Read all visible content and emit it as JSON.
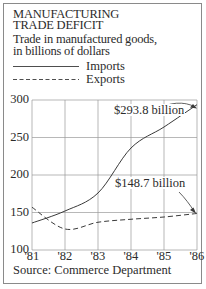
{
  "title": {
    "line1": "MANUFACTURING",
    "line2": "TRADE DEFICIT"
  },
  "subtitle": {
    "line1": "Trade in manufactured goods,",
    "line2": "in billions of dollars"
  },
  "legend": [
    {
      "label": "Imports",
      "style": "solid"
    },
    {
      "label": "Exports",
      "style": "dashed"
    }
  ],
  "annotations": {
    "imports_end": "$293.8 billion",
    "exports_end": "$148.7 billion"
  },
  "source": "Source: Commerce Department",
  "colors": {
    "line": "#3a3a3a",
    "grid": "#9a9a9a",
    "frame": "#8a8a8a",
    "background": "#ffffff"
  },
  "chart_data": {
    "type": "line",
    "title": "MANUFACTURING TRADE DEFICIT",
    "subtitle": "Trade in manufactured goods, in billions of dollars",
    "xlabel": "",
    "ylabel": "",
    "x": [
      "'81",
      "'82",
      "'83",
      "'84",
      "'85",
      "'86"
    ],
    "x_values": [
      1981,
      1982,
      1983,
      1984,
      1985,
      1986
    ],
    "y_ticks": [
      100,
      150,
      200,
      250,
      300
    ],
    "ylim": [
      100,
      300
    ],
    "grid": true,
    "legend_position": "top-left, above plot",
    "series": [
      {
        "name": "Imports",
        "style": "solid",
        "values": [
          136,
          152,
          176,
          236,
          264,
          293.8
        ]
      },
      {
        "name": "Exports",
        "style": "dashed",
        "values": [
          157,
          128,
          137,
          141,
          144,
          148.7
        ]
      }
    ],
    "annotations": [
      {
        "text": "$293.8 billion",
        "points_to": {
          "series": "Imports",
          "x": "'86",
          "y": 293.8
        }
      },
      {
        "text": "$148.7 billion",
        "points_to": {
          "series": "Exports",
          "x": "'86",
          "y": 148.7
        }
      }
    ],
    "source": "Source: Commerce Department"
  }
}
